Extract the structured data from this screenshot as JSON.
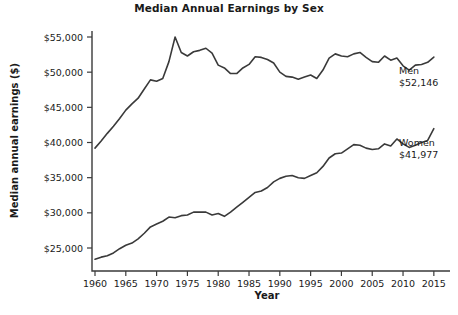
{
  "chart_data": {
    "type": "line",
    "title": "Median Annual Earnings by Sex",
    "xlabel": "Year",
    "ylabel": "Median annual earnings ($)",
    "xlim": [
      1960,
      2016
    ],
    "ylim": [
      22000,
      56500
    ],
    "xticks": [
      1960,
      1965,
      1970,
      1975,
      1980,
      1985,
      1990,
      1995,
      2000,
      2005,
      2010,
      2015
    ],
    "xticklabels": [
      "1960",
      "1965",
      "1970",
      "1975",
      "1980",
      "1985",
      "1990",
      "1995",
      "2000",
      "2005",
      "2010",
      "2015"
    ],
    "yticks": [
      25000,
      30000,
      35000,
      40000,
      45000,
      50000,
      55000
    ],
    "yticklabels": [
      "$25,000",
      "$30,000",
      "$35,000",
      "$40,000",
      "$45,000",
      "$50,000",
      "$55,000"
    ],
    "grid": false,
    "legend": "inline-annotations",
    "line_color": "#3a3a3a",
    "x": [
      1960,
      1961,
      1962,
      1963,
      1964,
      1965,
      1966,
      1967,
      1968,
      1969,
      1970,
      1971,
      1972,
      1973,
      1974,
      1975,
      1976,
      1977,
      1978,
      1979,
      1980,
      1981,
      1982,
      1983,
      1984,
      1985,
      1986,
      1987,
      1988,
      1989,
      1990,
      1991,
      1992,
      1993,
      1994,
      1995,
      1996,
      1997,
      1998,
      1999,
      2000,
      2001,
      2002,
      2003,
      2004,
      2005,
      2006,
      2007,
      2008,
      2009,
      2010,
      2011,
      2012,
      2013,
      2014,
      2015
    ],
    "series": [
      {
        "name": "Men",
        "end_label": "Men",
        "end_value_label": "$52,146",
        "end_value": 52146,
        "values": [
          39200,
          40200,
          41300,
          42300,
          43400,
          44600,
          45500,
          46300,
          47600,
          48900,
          48700,
          49100,
          51500,
          55000,
          52800,
          52300,
          52900,
          53100,
          53400,
          52700,
          51000,
          50600,
          49800,
          49800,
          50600,
          51100,
          52200,
          52100,
          51800,
          51300,
          50000,
          49400,
          49300,
          49000,
          49300,
          49600,
          49100,
          50300,
          52000,
          52600,
          52300,
          52200,
          52600,
          52800,
          52100,
          51500,
          51400,
          52300,
          51700,
          52000,
          50900,
          50300,
          51000,
          51100,
          51400,
          52146
        ]
      },
      {
        "name": "Women",
        "end_label": "Women",
        "end_value_label": "$41,977",
        "end_value": 41977,
        "values": [
          23400,
          23700,
          23900,
          24300,
          24900,
          25400,
          25700,
          26300,
          27100,
          28000,
          28400,
          28800,
          29400,
          29300,
          29600,
          29700,
          30100,
          30100,
          30100,
          29700,
          29900,
          29500,
          30100,
          30800,
          31500,
          32200,
          32900,
          33100,
          33600,
          34400,
          34900,
          35200,
          35300,
          35000,
          34900,
          35300,
          35700,
          36600,
          37800,
          38400,
          38500,
          39100,
          39700,
          39600,
          39200,
          39000,
          39100,
          39800,
          39500,
          40500,
          39800,
          39300,
          39600,
          40000,
          40300,
          41977
        ]
      }
    ]
  }
}
